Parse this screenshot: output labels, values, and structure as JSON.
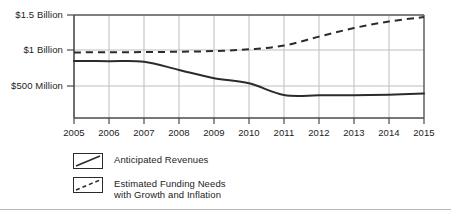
{
  "chart_data": {
    "type": "line",
    "title": "",
    "subtitle": "",
    "xlabel": "",
    "ylabel": "",
    "grid": true,
    "legend_position": "bottom-left",
    "x": [
      2005,
      2006,
      2007,
      2008,
      2009,
      2010,
      2011,
      2012,
      2013,
      2014,
      2015
    ],
    "categories": [
      "2005",
      "2006",
      "2007",
      "2008",
      "2009",
      "2010",
      "2011",
      "2012",
      "2013",
      "2014",
      "2015"
    ],
    "xtick_labels": [
      "2005",
      "2006",
      "2007",
      "2008",
      "2009",
      "2010",
      "2011",
      "2012",
      "2013",
      "2014",
      "2015"
    ],
    "ytick_labels": [
      "$1.5 Billion",
      "$1 Billion",
      "$500 Million"
    ],
    "ytick_values": [
      1500,
      1000,
      500
    ],
    "yunit": "millions of dollars",
    "ylim": [
      0,
      1500
    ],
    "xlim": [
      2005,
      2015
    ],
    "series": [
      {
        "name": "Anticipated Revenues",
        "style": "solid",
        "color": "#2b2b2b",
        "values": [
          830,
          828,
          820,
          700,
          580,
          505,
          335,
          330,
          332,
          340,
          355
        ]
      },
      {
        "name": "Estimated Funding Needs with Growth and Inflation",
        "style": "dashed",
        "color": "#2b2b2b",
        "values": [
          955,
          958,
          960,
          965,
          975,
          1000,
          1055,
          1185,
          1310,
          1405,
          1470
        ]
      }
    ]
  },
  "axis": {
    "y_labels": [
      {
        "text": "$1.5 Billion",
        "top": 10
      },
      {
        "text": "$1 Billion",
        "top": 45
      },
      {
        "text": "$500 Million",
        "top": 81
      }
    ],
    "x_labels": [
      {
        "text": "2005",
        "center": 74
      },
      {
        "text": "2006",
        "center": 109
      },
      {
        "text": "2007",
        "center": 144
      },
      {
        "text": "2008",
        "center": 179
      },
      {
        "text": "2009",
        "center": 214
      },
      {
        "text": "2010",
        "center": 249
      },
      {
        "text": "2011",
        "center": 284
      },
      {
        "text": "2012",
        "center": 319
      },
      {
        "text": "2013",
        "center": 354
      },
      {
        "text": "2014",
        "center": 389
      },
      {
        "text": "2015",
        "center": 424
      }
    ]
  },
  "legend": {
    "items": [
      {
        "label": "Anticipated Revenues",
        "style": "solid",
        "top": 153
      },
      {
        "label": "Estimated Funding Needs\nwith Growth and Inflation",
        "style": "dashed",
        "top": 177
      }
    ]
  },
  "footer": {
    "rule_top": 209,
    "smudge_text": ""
  }
}
